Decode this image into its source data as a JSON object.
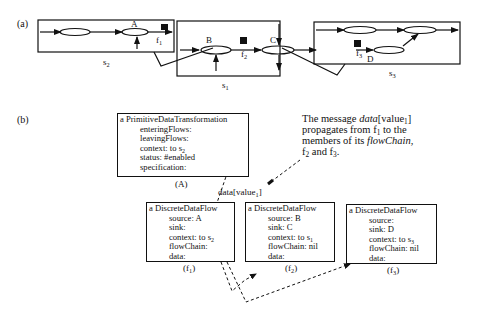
{
  "figure": {
    "panel_a": {
      "label": "(a)",
      "scopes": [
        {
          "id": "s2",
          "name": "s",
          "sub": "2"
        },
        {
          "id": "s1",
          "name": "s",
          "sub": "1"
        },
        {
          "id": "s3",
          "name": "s",
          "sub": "3"
        }
      ],
      "nodes": [
        {
          "id": "A",
          "label": "A"
        },
        {
          "id": "B",
          "label": "B"
        },
        {
          "id": "C",
          "label": "C"
        },
        {
          "id": "D",
          "label": "D"
        }
      ],
      "flows": [
        {
          "id": "f1",
          "name": "f",
          "sub": "1"
        },
        {
          "id": "f2",
          "name": "f",
          "sub": "2"
        },
        {
          "id": "f3",
          "name": "f",
          "sub": "3"
        }
      ]
    },
    "panel_b": {
      "label": "(b)",
      "transformation": {
        "title": "a PrimitiveDataTransformation",
        "fields": [
          "enteringFlows:",
          "leavingFlows:",
          "context: to s",
          "status: #enabled",
          "specification:"
        ],
        "context_sub": "2",
        "caption": "(A)"
      },
      "message_label": {
        "text": "data[value",
        "sub": "1",
        "close": "]"
      },
      "note": {
        "line1_pre": "The message ",
        "line1_italic": "data",
        "line1_post": "[value",
        "line1_sub": "1",
        "line1_end": "]",
        "line2_pre": "propagates from f",
        "line2_sub": "1",
        "line2_post": " to the",
        "line3_pre": "members of its ",
        "line3_italic": "flowChain",
        "line3_post": ",",
        "line4_a": "f",
        "line4_a_sub": "2",
        "line4_mid": " and f",
        "line4_b_sub": "3",
        "line4_end": "."
      },
      "flows": [
        {
          "title": "a DiscreteDataFlow",
          "source": "source: A",
          "sink": "sink:",
          "context": "context: to s",
          "context_sub": "2",
          "flowChain": "flowChain:",
          "data": "data:",
          "caption_name": "(f",
          "caption_sub": "1",
          "caption_close": ")"
        },
        {
          "title": "a DiscreteDataFlow",
          "source": "source: B",
          "sink": "sink: C",
          "context": "context: to s",
          "context_sub": "1",
          "flowChain": "flowChain: nil",
          "data": "data:",
          "caption_name": "(f",
          "caption_sub": "2",
          "caption_close": ")"
        },
        {
          "title": "a DiscreteDataFlow",
          "source": "source:",
          "sink": "sink: D",
          "context": "context: to s",
          "context_sub": "3",
          "flowChain": "flowChain: nil",
          "data": "data:",
          "caption_name": "(f",
          "caption_sub": "3",
          "caption_close": ")"
        }
      ]
    }
  }
}
